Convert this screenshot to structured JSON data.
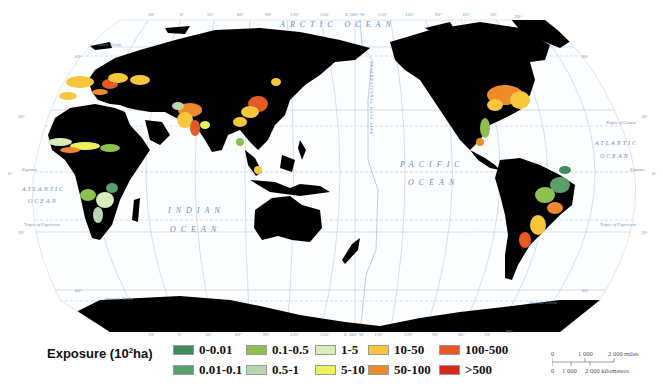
{
  "map": {
    "projection_grid": {
      "top_longitude_labels": [
        "30°",
        "0°",
        "30°",
        "60°",
        "90°",
        "120°",
        "150°",
        "E 180° W",
        "150°",
        "120°",
        "90°",
        "60°",
        "30°",
        "90°"
      ],
      "bottom_longitude_labels": [
        "30°",
        "0°",
        "30°",
        "60°",
        "90°",
        "120°",
        "150°",
        "E 180° W",
        "150°",
        "120°",
        "90°",
        "60°",
        "30°",
        "90°"
      ],
      "left_latitude_labels": [
        "60°",
        "30°",
        "0°",
        "30°",
        "60°"
      ],
      "right_latitude_labels": [
        "60°",
        "30°",
        "0°",
        "30°",
        "60°"
      ]
    },
    "ocean_labels": {
      "arctic": "ARCTIC OCEAN",
      "pacific_1": "PACIFIC",
      "pacific_2": "OCEAN",
      "indian_1": "INDIAN",
      "indian_2": "OCEAN",
      "atlantic_w_1": "ATLANTIC",
      "atlantic_w_2": "OCEAN",
      "atlantic_e_1": "ATLANTIC",
      "atlantic_e_2": "OCEAN"
    },
    "line_labels": {
      "equator_left": "Equator",
      "equator_right": "Equator",
      "tropic_capricorn_left": "Tropic of Capricorn",
      "tropic_capricorn_right": "Tropic of Capricorn",
      "tropic_cancer_right": "Tropic of Cancer",
      "arctic_circle": "Arctic Circle",
      "antarctic_circle_left": "Antarctic Circle",
      "antarctic_circle_right": "Antarctic Circle",
      "date_line": "INTERNATIONAL DATE LINE"
    },
    "colors": {
      "land": "#000000",
      "ocean": "#ffffff",
      "graticule": "#a9c3dd",
      "label": "#6f8fb3"
    }
  },
  "legend": {
    "title_prefix": "Exposure (10",
    "title_sup": "2",
    "title_suffix": "ha)",
    "items": [
      {
        "label": "0-0.01",
        "color": "#3f8a5c"
      },
      {
        "label": "0.01-0.1",
        "color": "#5aa06a"
      },
      {
        "label": "0.1-0.5",
        "color": "#8cc04f"
      },
      {
        "label": "0.5-1",
        "color": "#b9d6ae"
      },
      {
        "label": "1-5",
        "color": "#d8edb9"
      },
      {
        "label": "5-10",
        "color": "#eef25a"
      },
      {
        "label": "10-50",
        "color": "#f8c63a"
      },
      {
        "label": "50-100",
        "color": "#ef8a2a"
      },
      {
        "label": "100-500",
        "color": "#e45a24"
      },
      {
        "label": ">500",
        "color": "#d8261c"
      }
    ]
  },
  "scale_bar": {
    "miles_labels": [
      "0",
      "1 000",
      "2 000 miles"
    ],
    "km_labels": [
      "0",
      "1 000",
      "2 000 kilometers"
    ]
  }
}
